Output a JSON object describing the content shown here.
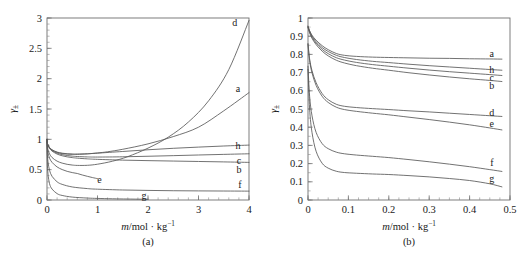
{
  "figure": {
    "caption_a": "(a)",
    "caption_b": "(b)"
  },
  "chart_data": [
    {
      "id": "panel-a",
      "type": "line",
      "title": "",
      "panel_label": "(a)",
      "xlabel": "m/mol · kg⁻¹",
      "ylabel": "γ±",
      "xlim": [
        0,
        4
      ],
      "ylim": [
        0,
        3
      ],
      "xticks": [
        0,
        1,
        2,
        3,
        4
      ],
      "xticklabels": [
        "0",
        "1",
        "2",
        "3",
        "4"
      ],
      "yticks": [
        0,
        0.5,
        1,
        1.5,
        2,
        2.5,
        3
      ],
      "yticklabels": [
        "0",
        "0.5",
        "1",
        "1.5",
        "2",
        "2.5",
        "3"
      ],
      "minor_x_interval": 0.2,
      "minor_y_interval": 0.1,
      "grid": false,
      "legend_position": "inline-right",
      "series": [
        {
          "name": "a",
          "label": "a",
          "label_at": [
            3.78,
            1.83
          ],
          "x": [
            0,
            0.005,
            0.02,
            0.05,
            0.1,
            0.2,
            0.3,
            0.4,
            0.5,
            0.6,
            0.8,
            1.0,
            1.2,
            1.5,
            2.0,
            2.5,
            3.0,
            3.5,
            4.0
          ],
          "values": [
            1.0,
            0.945,
            0.905,
            0.862,
            0.824,
            0.785,
            0.766,
            0.757,
            0.753,
            0.753,
            0.76,
            0.775,
            0.795,
            0.836,
            0.925,
            1.045,
            1.2,
            1.47,
            1.77
          ]
        },
        {
          "name": "b",
          "label": "b",
          "label_at": [
            3.8,
            0.5
          ],
          "x": [
            0,
            0.005,
            0.02,
            0.05,
            0.1,
            0.2,
            0.3,
            0.4,
            0.5,
            0.6,
            0.8,
            1.0,
            1.5,
            2.0,
            2.5,
            3.0,
            3.5,
            4.0
          ],
          "values": [
            1.0,
            0.942,
            0.9,
            0.852,
            0.806,
            0.757,
            0.729,
            0.711,
            0.699,
            0.69,
            0.678,
            0.67,
            0.657,
            0.649,
            0.642,
            0.635,
            0.628,
            0.62
          ]
        },
        {
          "name": "c",
          "label": "c",
          "label_at": [
            3.8,
            0.655
          ],
          "x": [
            0,
            0.005,
            0.02,
            0.05,
            0.1,
            0.2,
            0.3,
            0.4,
            0.5,
            0.6,
            0.8,
            1.0,
            1.5,
            2.0,
            2.5,
            3.0,
            3.5,
            4.0
          ],
          "values": [
            1.0,
            0.944,
            0.903,
            0.858,
            0.816,
            0.772,
            0.748,
            0.733,
            0.723,
            0.717,
            0.71,
            0.708,
            0.712,
            0.721,
            0.731,
            0.742,
            0.752,
            0.762
          ]
        },
        {
          "name": "d",
          "label": "d",
          "label_at": [
            3.72,
            2.92
          ],
          "x": [
            0,
            0.005,
            0.02,
            0.05,
            0.1,
            0.2,
            0.3,
            0.4,
            0.5,
            0.6,
            0.8,
            1.0,
            1.3,
            1.6,
            2.0,
            2.4,
            2.8,
            3.2,
            3.6,
            4.0
          ],
          "values": [
            1.0,
            0.9,
            0.83,
            0.76,
            0.7,
            0.64,
            0.608,
            0.588,
            0.576,
            0.57,
            0.572,
            0.59,
            0.64,
            0.715,
            0.855,
            1.035,
            1.285,
            1.635,
            2.15,
            2.96
          ]
        },
        {
          "name": "e",
          "label": "e",
          "label_at": [
            1.04,
            0.34
          ],
          "x": [
            0,
            0.005,
            0.02,
            0.05,
            0.1,
            0.2,
            0.3,
            0.4,
            0.5,
            0.6,
            0.7,
            0.8,
            0.9,
            1.0
          ],
          "values": [
            1.0,
            0.87,
            0.775,
            0.69,
            0.62,
            0.545,
            0.502,
            0.472,
            0.452,
            0.437,
            0.412,
            0.39,
            0.37,
            0.352
          ]
        },
        {
          "name": "f",
          "label": "f",
          "label_at": [
            3.82,
            0.255
          ],
          "x": [
            0,
            0.005,
            0.02,
            0.05,
            0.1,
            0.2,
            0.3,
            0.5,
            0.8,
            1.0,
            1.5,
            2.0,
            2.5,
            3.0,
            3.5,
            4.0
          ],
          "values": [
            1.0,
            0.79,
            0.63,
            0.49,
            0.39,
            0.3,
            0.258,
            0.215,
            0.188,
            0.178,
            0.165,
            0.158,
            0.153,
            0.15,
            0.148,
            0.146
          ]
        },
        {
          "name": "g",
          "label": "g",
          "label_at": [
            1.92,
            0.075
          ],
          "x": [
            0,
            0.005,
            0.02,
            0.05,
            0.1,
            0.2,
            0.3,
            0.5,
            0.8,
            1.0,
            1.3,
            1.6,
            2.0
          ],
          "values": [
            1.0,
            0.64,
            0.43,
            0.27,
            0.18,
            0.105,
            0.075,
            0.048,
            0.032,
            0.026,
            0.02,
            0.016,
            0.012
          ]
        },
        {
          "name": "h",
          "label": "h",
          "label_at": [
            3.78,
            0.895
          ],
          "x": [
            0,
            0.005,
            0.02,
            0.05,
            0.1,
            0.2,
            0.3,
            0.4,
            0.5,
            0.6,
            0.8,
            1.0,
            1.5,
            2.0,
            2.5,
            3.0,
            3.5,
            4.0
          ],
          "values": [
            1.0,
            0.946,
            0.908,
            0.866,
            0.828,
            0.79,
            0.772,
            0.762,
            0.758,
            0.757,
            0.762,
            0.772,
            0.8,
            0.828,
            0.852,
            0.872,
            0.89,
            0.905
          ]
        }
      ]
    },
    {
      "id": "panel-b",
      "type": "line",
      "title": "",
      "panel_label": "(b)",
      "xlabel": "m/mol · kg⁻¹",
      "ylabel": "γ±",
      "xlim": [
        0,
        0.5
      ],
      "ylim": [
        0,
        1
      ],
      "xticks": [
        0,
        0.1,
        0.2,
        0.3,
        0.4,
        0.5
      ],
      "xticklabels": [
        "0",
        "0.1",
        "0.2",
        "0.3",
        "0.4",
        "0.5"
      ],
      "yticks": [
        0,
        0.1,
        0.2,
        0.3,
        0.4,
        0.5,
        0.6,
        0.7,
        0.8,
        0.9,
        1
      ],
      "yticklabels": [
        "0",
        "0.1",
        "0.2",
        "0.3",
        "0.4",
        "0.5",
        "0.6",
        "0.7",
        "0.8",
        "0.9",
        "1"
      ],
      "minor_x_interval": 0.025,
      "minor_y_interval": 0.05,
      "grid": false,
      "legend_position": "inline-right",
      "series": [
        {
          "name": "a",
          "label": "a",
          "label_at": [
            0.455,
            0.805
          ],
          "x": [
            0,
            0.004,
            0.01,
            0.02,
            0.035,
            0.05,
            0.07,
            0.09,
            0.12,
            0.16,
            0.2,
            0.25,
            0.3,
            0.35,
            0.4,
            0.45,
            0.48
          ],
          "values": [
            0.955,
            0.93,
            0.905,
            0.878,
            0.848,
            0.826,
            0.805,
            0.795,
            0.789,
            0.785,
            0.783,
            0.781,
            0.779,
            0.778,
            0.776,
            0.775,
            0.774
          ]
        },
        {
          "name": "h",
          "label": "h",
          "label_at": [
            0.455,
            0.715
          ],
          "x": [
            0,
            0.004,
            0.01,
            0.02,
            0.035,
            0.05,
            0.07,
            0.09,
            0.12,
            0.16,
            0.2,
            0.25,
            0.3,
            0.35,
            0.4,
            0.45,
            0.48
          ],
          "values": [
            0.955,
            0.928,
            0.9,
            0.87,
            0.838,
            0.816,
            0.795,
            0.783,
            0.772,
            0.762,
            0.755,
            0.746,
            0.738,
            0.731,
            0.724,
            0.717,
            0.713
          ]
        },
        {
          "name": "c",
          "label": "c",
          "label_at": [
            0.455,
            0.675
          ],
          "x": [
            0,
            0.004,
            0.01,
            0.02,
            0.035,
            0.05,
            0.07,
            0.09,
            0.12,
            0.16,
            0.2,
            0.25,
            0.3,
            0.35,
            0.4,
            0.45,
            0.48
          ],
          "values": [
            0.95,
            0.922,
            0.894,
            0.862,
            0.828,
            0.804,
            0.782,
            0.769,
            0.756,
            0.744,
            0.735,
            0.724,
            0.714,
            0.705,
            0.697,
            0.689,
            0.684
          ]
        },
        {
          "name": "b",
          "label": "b",
          "label_at": [
            0.455,
            0.628
          ],
          "x": [
            0,
            0.004,
            0.01,
            0.02,
            0.035,
            0.05,
            0.07,
            0.09,
            0.12,
            0.16,
            0.2,
            0.25,
            0.3,
            0.35,
            0.4,
            0.45,
            0.48
          ],
          "values": [
            0.948,
            0.918,
            0.888,
            0.854,
            0.818,
            0.792,
            0.768,
            0.753,
            0.738,
            0.724,
            0.713,
            0.699,
            0.687,
            0.676,
            0.666,
            0.657,
            0.651
          ]
        },
        {
          "name": "d",
          "label": "d",
          "label_at": [
            0.455,
            0.478
          ],
          "x": [
            0,
            0.004,
            0.01,
            0.02,
            0.035,
            0.05,
            0.07,
            0.09,
            0.12,
            0.16,
            0.2,
            0.25,
            0.3,
            0.35,
            0.4,
            0.45,
            0.48
          ],
          "values": [
            0.86,
            0.775,
            0.71,
            0.645,
            0.585,
            0.551,
            0.526,
            0.515,
            0.508,
            0.502,
            0.497,
            0.49,
            0.484,
            0.477,
            0.47,
            0.463,
            0.459
          ]
        },
        {
          "name": "e",
          "label": "e",
          "label_at": [
            0.455,
            0.418
          ],
          "x": [
            0,
            0.004,
            0.01,
            0.02,
            0.035,
            0.05,
            0.07,
            0.09,
            0.12,
            0.16,
            0.2,
            0.25,
            0.3,
            0.35,
            0.4,
            0.45,
            0.48
          ],
          "values": [
            0.855,
            0.765,
            0.698,
            0.63,
            0.57,
            0.536,
            0.51,
            0.497,
            0.487,
            0.477,
            0.468,
            0.455,
            0.442,
            0.428,
            0.413,
            0.396,
            0.385
          ]
        },
        {
          "name": "f",
          "label": "f",
          "label_at": [
            0.455,
            0.208
          ],
          "x": [
            0,
            0.004,
            0.01,
            0.02,
            0.035,
            0.05,
            0.07,
            0.09,
            0.12,
            0.16,
            0.2,
            0.25,
            0.3,
            0.35,
            0.4,
            0.45,
            0.48
          ],
          "values": [
            0.735,
            0.57,
            0.462,
            0.372,
            0.31,
            0.282,
            0.263,
            0.254,
            0.247,
            0.24,
            0.233,
            0.222,
            0.21,
            0.197,
            0.183,
            0.167,
            0.157
          ]
        },
        {
          "name": "g",
          "label": "g",
          "label_at": [
            0.455,
            0.118
          ],
          "x": [
            0,
            0.004,
            0.01,
            0.02,
            0.035,
            0.05,
            0.07,
            0.09,
            0.12,
            0.16,
            0.2,
            0.25,
            0.3,
            0.35,
            0.4,
            0.45,
            0.48
          ],
          "values": [
            0.718,
            0.5,
            0.37,
            0.268,
            0.202,
            0.175,
            0.158,
            0.151,
            0.147,
            0.143,
            0.14,
            0.134,
            0.127,
            0.118,
            0.107,
            0.089,
            0.072
          ]
        }
      ]
    }
  ]
}
